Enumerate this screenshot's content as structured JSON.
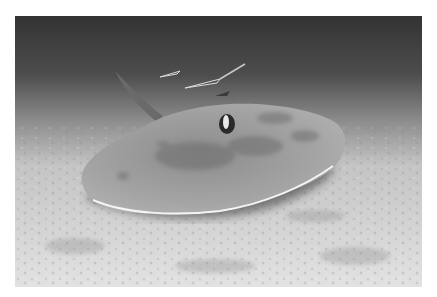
{
  "image": {
    "subject": "stingray on sandy sea floor",
    "description": "Grayscale underwater photograph of a stingray resting on a sandy seabed with small fish swimming above it",
    "colors": {
      "water_top": "#3a3a3a",
      "water_mid": "#6e6e6e",
      "sand_light": "#e4e4e4",
      "sand_mid": "#bdbdbd",
      "ray_body": "#9a9a9a",
      "ray_shadow": "#4a4a4a",
      "ray_edge": "#f2f2f2"
    }
  }
}
